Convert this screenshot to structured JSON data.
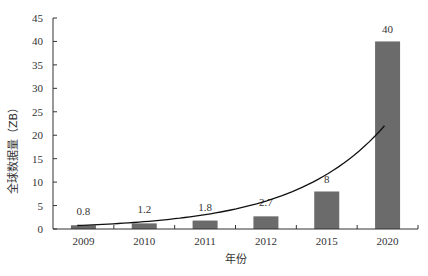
{
  "chart_data": {
    "type": "bar",
    "title": "",
    "xlabel": "年份",
    "ylabel": "全球数据量（ZB）",
    "categories": [
      "2009",
      "2010",
      "2011",
      "2012",
      "2015",
      "2020"
    ],
    "values": [
      0.8,
      1.2,
      1.8,
      2.7,
      8,
      40
    ],
    "data_labels": [
      "0.8",
      "1.2",
      "1.8",
      "2.7",
      "8",
      "40"
    ],
    "ylim": [
      0,
      45
    ],
    "yticks": [
      0,
      5,
      10,
      15,
      20,
      25,
      30,
      35,
      40,
      45
    ],
    "grid": false,
    "legend": null,
    "bar_color": "#6b6b6b",
    "trendline": {
      "type": "exponential",
      "color": "#111111"
    }
  }
}
